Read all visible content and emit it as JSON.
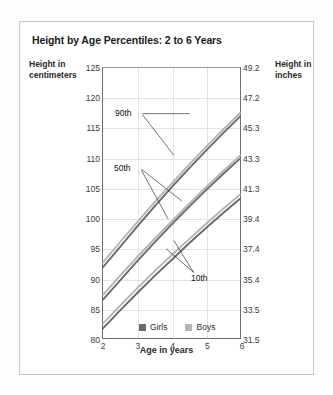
{
  "figure": {
    "title": "Height by Age Percentiles: 2 to 6 Years",
    "y_label_left": "Height in centimeters",
    "y_label_right": "Height in inches",
    "x_label": "Age in years"
  },
  "legend": {
    "items": [
      {
        "label": "Girls",
        "color": "#6a6a6a"
      },
      {
        "label": "Boys",
        "color": "#b4b4b4"
      }
    ]
  },
  "annotations": [
    {
      "label": "90th"
    },
    {
      "label": "50th"
    },
    {
      "label": "10th"
    }
  ],
  "axis_left": {
    "ticks": [
      "125",
      "120",
      "115",
      "110",
      "105",
      "100",
      "95",
      "90",
      "85",
      "80"
    ]
  },
  "axis_right": {
    "ticks": [
      "49.2",
      "47.2",
      "45.3",
      "43.3",
      "41.3",
      "39.4",
      "37.4",
      "35.4",
      "33.5",
      "31.5"
    ]
  },
  "axis_x": {
    "ticks": [
      "2",
      "3",
      "4",
      "5",
      "6"
    ]
  },
  "chart_data": {
    "type": "line",
    "title": "Height by Age Percentiles: 2 to 6 Years",
    "xlabel": "Age in years",
    "ylabel": "Height in centimeters",
    "ylabel_secondary": "Height in inches",
    "x": [
      2,
      2.5,
      3,
      3.5,
      4,
      4.5,
      5,
      5.5,
      6
    ],
    "xlim": [
      2,
      6
    ],
    "ylim": [
      80,
      125
    ],
    "ylim_secondary": [
      31.5,
      49.2
    ],
    "yticks": [
      80,
      85,
      90,
      95,
      100,
      105,
      110,
      115,
      120,
      125
    ],
    "yticks_secondary": [
      31.5,
      33.5,
      35.4,
      37.4,
      39.4,
      41.3,
      43.3,
      45.3,
      47.2,
      49.2
    ],
    "xticks": [
      2,
      3,
      4,
      5,
      6
    ],
    "grid": true,
    "legend_position": "bottom-center",
    "series": [
      {
        "name": "Boys 90th",
        "percentile": "90th",
        "group": "Boys",
        "color": "#b4b4b4",
        "values": [
          92.6,
          96.0,
          99.3,
          102.6,
          105.7,
          108.8,
          111.8,
          114.7,
          117.5
        ]
      },
      {
        "name": "Girls 90th",
        "percentile": "90th",
        "group": "Girls",
        "color": "#6a6a6a",
        "values": [
          91.8,
          95.2,
          98.6,
          101.9,
          105.1,
          108.2,
          111.2,
          114.1,
          116.9
        ]
      },
      {
        "name": "Boys 50th",
        "percentile": "50th",
        "group": "Boys",
        "color": "#b4b4b4",
        "values": [
          87.2,
          90.4,
          93.5,
          96.5,
          99.4,
          102.3,
          105.1,
          107.8,
          110.4
        ]
      },
      {
        "name": "Girls 50th",
        "percentile": "50th",
        "group": "Girls",
        "color": "#6a6a6a",
        "values": [
          86.4,
          89.6,
          92.8,
          95.9,
          98.9,
          101.8,
          104.6,
          107.3,
          109.9
        ]
      },
      {
        "name": "Boys 10th",
        "percentile": "10th",
        "group": "Boys",
        "color": "#b4b4b4",
        "values": [
          82.4,
          85.4,
          88.3,
          91.1,
          93.8,
          96.4,
          99.0,
          101.5,
          103.9
        ]
      },
      {
        "name": "Girls 10th",
        "percentile": "10th",
        "group": "Girls",
        "color": "#6a6a6a",
        "values": [
          81.6,
          84.6,
          87.5,
          90.3,
          93.0,
          95.7,
          98.3,
          100.8,
          103.2
        ]
      }
    ]
  }
}
